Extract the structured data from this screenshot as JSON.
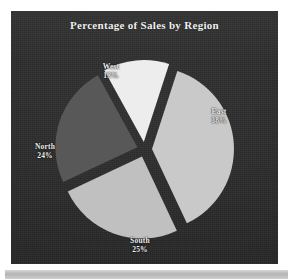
{
  "page": {
    "background_color": "#ffffff",
    "panel_color": "#2a2a2a",
    "bottom_band_color": "#c4c4c4"
  },
  "chart": {
    "title": "Percentage of Sales by Region"
  },
  "chart_data": {
    "type": "pie",
    "title": "Percentage of Sales by Region",
    "xlabel": "",
    "ylabel": "",
    "exploded": true,
    "labels_show_percent": true,
    "legend_position": "none",
    "grid": false,
    "background_color": "#2a2a2a",
    "categories": [
      "East",
      "South",
      "North",
      "West"
    ],
    "values": [
      38,
      25,
      24,
      13
    ],
    "slices": [
      {
        "name": "East",
        "label": "East",
        "percent": 38,
        "percent_text": "38%",
        "color": "#c9c9c9",
        "label_position": "right"
      },
      {
        "name": "South",
        "label": "South",
        "percent": 25,
        "percent_text": "25%",
        "color": "#c0c0c0",
        "label_position": "bottom"
      },
      {
        "name": "North",
        "label": "North",
        "percent": 24,
        "percent_text": "24%",
        "color": "#585858",
        "label_position": "left"
      },
      {
        "name": "West",
        "label": "West",
        "percent": 13,
        "percent_text": "13%",
        "color": "#ededed",
        "label_position": "top"
      }
    ]
  }
}
